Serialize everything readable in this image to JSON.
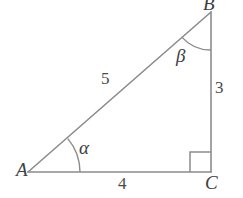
{
  "figure": {
    "type": "right-triangle-diagram",
    "background_color": "#ffffff",
    "stroke_color": "#8c8c8c",
    "text_color": "#3d3d3d",
    "vertices": {
      "A": {
        "label": "A",
        "x": 28,
        "y": 172
      },
      "B": {
        "label": "B",
        "x": 211,
        "y": 12
      },
      "C": {
        "label": "C",
        "x": 211,
        "y": 172
      }
    },
    "sides": {
      "hypotenuse": {
        "label": "5",
        "from": "A",
        "to": "B",
        "value": 5
      },
      "opposite": {
        "label": "3",
        "from": "B",
        "to": "C",
        "value": 3
      },
      "adjacent": {
        "label": "4",
        "from": "A",
        "to": "C",
        "value": 4
      }
    },
    "angles": {
      "alpha": {
        "label": "α",
        "at": "A"
      },
      "beta": {
        "label": "β",
        "at": "B"
      },
      "right_angle": {
        "label": "",
        "at": "C",
        "marker": "square"
      }
    }
  }
}
